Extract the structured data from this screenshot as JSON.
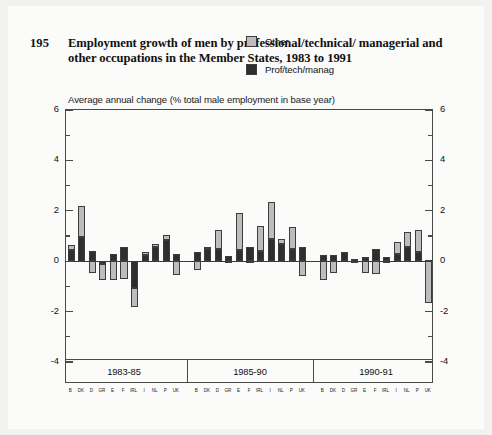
{
  "figure_number": "195",
  "title": "Employment growth of men by professional/technical/ managerial and other occupations in the Member States, 1983 to 1991",
  "subtitle": "Average annual change (% total male employment in base year)",
  "legend": {
    "position": "top-right",
    "items": [
      {
        "label": "Other",
        "color": "#bdbdbd",
        "key": "other"
      },
      {
        "label": "Prof/tech/manag",
        "color": "#2e2e2e",
        "key": "prof"
      }
    ]
  },
  "colors": {
    "other": "#bdbdbd",
    "prof": "#2e2e2e",
    "outline": "#3d3d3d",
    "axis": "#4a4a4a",
    "page_background": "#f2f2f0",
    "card_background": "#fbfbf9"
  },
  "axis": {
    "y_label_left": [
      "6",
      "4",
      "2",
      "0",
      "-2",
      "-4"
    ],
    "y_label_right": [
      "6",
      "4",
      "2",
      "0",
      "-2",
      "-4"
    ],
    "y_major_ticks": [
      6,
      4,
      2,
      0,
      -2,
      -4
    ],
    "y_minor_ticks": [
      5,
      3,
      1,
      -1,
      -3
    ],
    "ylim": [
      -4,
      6
    ],
    "grid": false
  },
  "periods": [
    {
      "label": "1983-85"
    },
    {
      "label": "1985-90"
    },
    {
      "label": "1990-91"
    }
  ],
  "country_codes": [
    "B",
    "DK",
    "D",
    "GR",
    "E",
    "F",
    "IRL",
    "I",
    "NL",
    "P",
    "UK"
  ],
  "chart_data": {
    "type": "bar",
    "subtitle": "Average annual change (% total male employment in base year)",
    "xlabel": "",
    "ylabel": "Average annual change (% total male employment in base year)",
    "ylim": [
      -4,
      6
    ],
    "stacked": true,
    "grid": false,
    "legend_position": "top-right",
    "categories": [
      "B",
      "DK",
      "D",
      "GR",
      "E",
      "F",
      "IRL",
      "I",
      "NL",
      "P",
      "UK"
    ],
    "groups": [
      {
        "period": "1983-85",
        "series": [
          {
            "name": "Prof/tech/manag",
            "values": [
              0.45,
              0.95,
              0.4,
              -0.1,
              0.3,
              0.55,
              -1.05,
              0.25,
              0.55,
              0.85,
              0.3
            ]
          },
          {
            "name": "Other",
            "values": [
              0.2,
              1.25,
              -0.45,
              -0.65,
              -0.75,
              -0.7,
              -0.75,
              0.1,
              0.15,
              0.2,
              -0.55
            ]
          }
        ]
      },
      {
        "period": "1985-90",
        "series": [
          {
            "name": "Prof/tech/manag",
            "values": [
              0.35,
              0.5,
              0.5,
              0.2,
              0.45,
              0.55,
              0.4,
              0.9,
              0.7,
              0.5,
              0.55
            ]
          },
          {
            "name": "Other",
            "values": [
              -0.35,
              0.05,
              0.75,
              -0.05,
              1.45,
              -0.05,
              1.0,
              1.45,
              0.2,
              0.85,
              -0.6
            ]
          }
        ]
      },
      {
        "period": "1990-91",
        "series": [
          {
            "name": "Prof/tech/manag",
            "values": [
              0.25,
              0.25,
              0.35,
              0.1,
              0.15,
              0.5,
              0.15,
              0.3,
              0.55,
              0.35,
              0.05
            ]
          },
          {
            "name": "Other",
            "values": [
              -0.75,
              -0.45,
              0.0,
              -0.05,
              -0.45,
              -0.5,
              -0.05,
              0.45,
              0.6,
              0.9,
              -1.65
            ]
          }
        ]
      }
    ]
  }
}
